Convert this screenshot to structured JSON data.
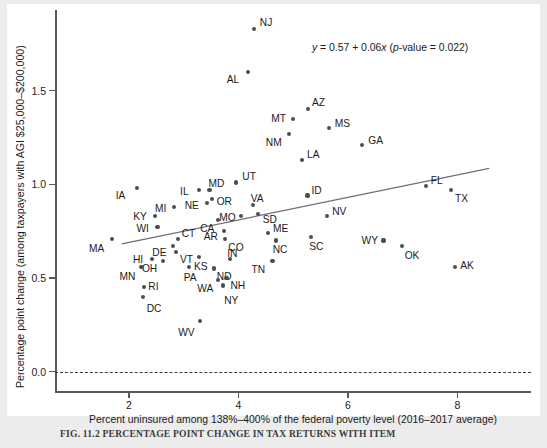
{
  "figure": {
    "caption": "FIG. 11.2     PERCENTAGE POINT CHANGE IN TAX RETURNS WITH ITEM",
    "annotation": "y = 0.57 + 0.06x (p-value = 0.022)"
  },
  "chart_data": {
    "type": "scatter",
    "title": "",
    "xlabel": "Percent uninsured among 138%–400% of the federal poverty level (2016–2017 average)",
    "ylabel": "Percentage point change (among taxpayers with AGI $25,000–$200,000)",
    "xticks": [
      2,
      4,
      6,
      8
    ],
    "yticks": [
      "0.0",
      "0.5",
      "1.0",
      "1.5"
    ],
    "xlim": [
      0.9,
      9.6
    ],
    "ylim": [
      -0.12,
      1.93
    ],
    "grid": false,
    "legend": null,
    "reference_line": {
      "y": 0.0,
      "style": "dashed"
    },
    "fit_line": {
      "equation": "y = 0.57 + 0.06x",
      "intercept": 0.57,
      "slope": 0.06,
      "p_value": 0.022,
      "x_start": 1.87,
      "x_end": 8.58
    },
    "point_label_key": "state",
    "points": [
      {
        "state": "NJ",
        "x": 4.28,
        "y": 1.83,
        "lx": 6,
        "ly": -11
      },
      {
        "state": "AL",
        "x": 4.17,
        "y": 1.6,
        "lx": -21,
        "ly": 3
      },
      {
        "state": "AZ",
        "x": 5.27,
        "y": 1.4,
        "lx": 4,
        "ly": -11
      },
      {
        "state": "MT",
        "x": 5.0,
        "y": 1.35,
        "lx": -22,
        "ly": -5
      },
      {
        "state": "MS",
        "x": 5.65,
        "y": 1.3,
        "lx": 6,
        "ly": -9
      },
      {
        "state": "NM",
        "x": 4.92,
        "y": 1.27,
        "lx": -23,
        "ly": 4
      },
      {
        "state": "GA",
        "x": 6.26,
        "y": 1.21,
        "lx": 6,
        "ly": -9
      },
      {
        "state": "LA",
        "x": 5.16,
        "y": 1.13,
        "lx": 5,
        "ly": -10
      },
      {
        "state": "UT",
        "x": 3.96,
        "y": 1.01,
        "lx": 6,
        "ly": -10
      },
      {
        "state": "FL",
        "x": 7.42,
        "y": 0.99,
        "lx": 5,
        "ly": -10
      },
      {
        "state": "MD",
        "x": 3.47,
        "y": 0.97,
        "lx": -1,
        "ly": -11
      },
      {
        "state": "IA",
        "x": 2.14,
        "y": 0.98,
        "lx": -21,
        "ly": 3
      },
      {
        "state": "TX",
        "x": 7.88,
        "y": 0.97,
        "lx": 4,
        "ly": 4
      },
      {
        "state": "IL",
        "x": 3.28,
        "y": 0.97,
        "lx": -19,
        "ly": -3
      },
      {
        "state": "ID",
        "x": 5.26,
        "y": 0.94,
        "lx": 4,
        "ly": -10
      },
      {
        "state": "OR",
        "x": 3.51,
        "y": 0.92,
        "lx": 5,
        "ly": -2
      },
      {
        "state": "NE",
        "x": 3.42,
        "y": 0.9,
        "lx": -22,
        "ly": -2
      },
      {
        "state": "MI",
        "x": 2.82,
        "y": 0.88,
        "lx": -19,
        "ly": -3
      },
      {
        "state": "VA",
        "x": 4.26,
        "y": 0.89,
        "lx": -2,
        "ly": -11
      },
      {
        "state": "MO",
        "x": 4.05,
        "y": 0.83,
        "lx": -22,
        "ly": -3
      },
      {
        "state": "SD",
        "x": 4.35,
        "y": 0.84,
        "lx": 5,
        "ly": 1
      },
      {
        "state": "KY",
        "x": 2.48,
        "y": 0.83,
        "lx": -22,
        "ly": -4
      },
      {
        "state": "CA",
        "x": 3.63,
        "y": 0.81,
        "lx": -18,
        "ly": 4
      },
      {
        "state": "NV",
        "x": 5.62,
        "y": 0.83,
        "lx": 5,
        "ly": -9
      },
      {
        "state": "WI",
        "x": 2.52,
        "y": 0.77,
        "lx": -21,
        "ly": -3
      },
      {
        "state": "AR",
        "x": 3.73,
        "y": 0.75,
        "lx": -20,
        "ly": 1
      },
      {
        "state": "ME",
        "x": 4.54,
        "y": 0.74,
        "lx": 5,
        "ly": -9
      },
      {
        "state": "CT",
        "x": 2.89,
        "y": 0.71,
        "lx": 4,
        "ly": -10
      },
      {
        "state": "MA",
        "x": 1.69,
        "y": 0.71,
        "lx": -23,
        "ly": 5
      },
      {
        "state": "CO",
        "x": 3.76,
        "y": 0.71,
        "lx": 3,
        "ly": 4
      },
      {
        "state": "SC",
        "x": 5.33,
        "y": 0.72,
        "lx": -2,
        "ly": 5
      },
      {
        "state": "NC",
        "x": 4.68,
        "y": 0.7,
        "lx": -3,
        "ly": 5
      },
      {
        "state": "WY",
        "x": 6.65,
        "y": 0.7,
        "lx": -22,
        "ly": -4
      },
      {
        "state": "DE",
        "x": 2.81,
        "y": 0.67,
        "lx": -21,
        "ly": 2
      },
      {
        "state": "OK",
        "x": 6.98,
        "y": 0.67,
        "lx": 3,
        "ly": 5
      },
      {
        "state": "VT",
        "x": 2.86,
        "y": 0.64,
        "lx": 4,
        "ly": 3
      },
      {
        "state": "KS",
        "x": 3.28,
        "y": 0.61,
        "lx": -5,
        "ly": 5
      },
      {
        "state": "IN",
        "x": 3.85,
        "y": 0.6,
        "lx": -3,
        "ly": -10
      },
      {
        "state": "HI",
        "x": 2.42,
        "y": 0.6,
        "lx": -19,
        "ly": -4
      },
      {
        "state": "OH",
        "x": 2.62,
        "y": 0.59,
        "lx": -21,
        "ly": 3
      },
      {
        "state": "TN",
        "x": 4.62,
        "y": 0.59,
        "lx": -21,
        "ly": 4
      },
      {
        "state": "MN",
        "x": 2.23,
        "y": 0.56,
        "lx": -22,
        "ly": 5
      },
      {
        "state": "AK",
        "x": 7.96,
        "y": 0.56,
        "lx": 5,
        "ly": -6
      },
      {
        "state": "ND",
        "x": 3.55,
        "y": 0.55,
        "lx": 3,
        "ly": 3
      },
      {
        "state": "PA",
        "x": 3.09,
        "y": 0.56,
        "lx": -5,
        "ly": 6
      },
      {
        "state": "NH",
        "x": 3.78,
        "y": 0.5,
        "lx": 4,
        "ly": 3
      },
      {
        "state": "WA",
        "x": 3.63,
        "y": 0.49,
        "lx": -21,
        "ly": 4
      },
      {
        "state": "NY",
        "x": 3.72,
        "y": 0.46,
        "lx": 1,
        "ly": 11
      },
      {
        "state": "RI",
        "x": 2.28,
        "y": 0.45,
        "lx": 4,
        "ly": -5
      },
      {
        "state": "DC",
        "x": 2.25,
        "y": 0.4,
        "lx": 4,
        "ly": 7
      },
      {
        "state": "WV",
        "x": 3.3,
        "y": 0.27,
        "lx": -22,
        "ly": 7
      }
    ]
  }
}
